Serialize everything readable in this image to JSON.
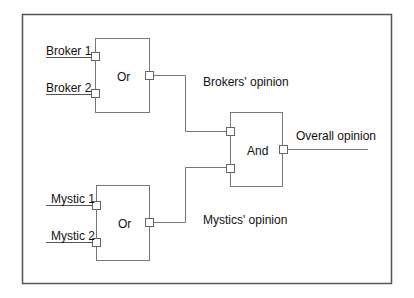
{
  "diagram": {
    "title": "",
    "colors": {
      "line": "#6b6b6b",
      "frame": "#555555",
      "text": "#111111",
      "background": "#ffffff"
    },
    "inputs": {
      "broker1": "Broker 1",
      "broker2": "Broker 2",
      "mystic1": "Mystic 1",
      "mystic2": "Mystic 2"
    },
    "gates": {
      "or_brokers": "Or",
      "or_mystics": "Or",
      "and": "And"
    },
    "signals": {
      "brokers_opinion": "Brokers' opinion",
      "mystics_opinion": "Mystics' opinion",
      "overall_opinion": "Overall opinion"
    }
  }
}
